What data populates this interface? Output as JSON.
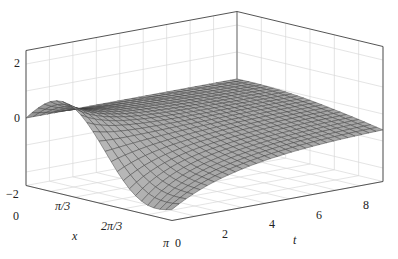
{
  "chart_data": {
    "type": "surface3d",
    "title": "",
    "axes": {
      "x": {
        "label": "x",
        "range": [
          0,
          3.14159
        ],
        "ticks": [
          "0",
          "π/3",
          "2π/3",
          "π"
        ]
      },
      "t": {
        "label": "t",
        "range": [
          0,
          9
        ],
        "ticks": [
          "0",
          "2",
          "4",
          "6",
          "8"
        ]
      },
      "z": {
        "label": "",
        "range": [
          -2.5,
          2.5
        ],
        "ticks": [
          "−2",
          "0",
          "2"
        ]
      }
    },
    "grid": true,
    "surface_color": "#9a9a9a",
    "mesh_color": "#3c3c3c",
    "box_color": "#555555",
    "grid_color": "#d8d8d8",
    "surface_samples": {
      "description": "approximate heights u(x,t); u=0 at x=0, maximum ~1 near x≈1 at t=0, minimum ~−2.3 near x=π at t=0, decaying toward ~−0.6 at large t",
      "x": [
        0,
        1.047,
        2.094,
        3.142
      ],
      "t": [
        0,
        3,
        6,
        9
      ],
      "z": [
        [
          0,
          0,
          0,
          0
        ],
        [
          0.9,
          0.2,
          -0.2,
          -0.3
        ],
        [
          -0.6,
          -0.5,
          -0.5,
          -0.5
        ],
        [
          -2.3,
          -1.2,
          -0.8,
          -0.7
        ]
      ]
    }
  },
  "labels": {
    "z_ticks": [
      "2",
      "0",
      "−2"
    ],
    "x_ticks": [
      "0",
      "π/3",
      "2π/3",
      "π"
    ],
    "t_ticks": [
      "0",
      "2",
      "4",
      "6",
      "8"
    ],
    "x_label": "x",
    "t_label": "t"
  }
}
